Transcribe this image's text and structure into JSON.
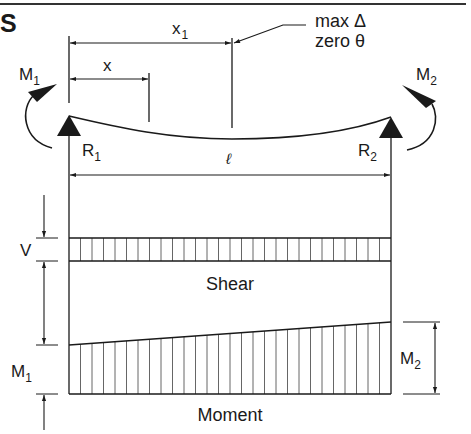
{
  "header": {
    "title_fragment": "S"
  },
  "beam": {
    "labels": {
      "x1": "x",
      "x1_sub": "1",
      "x": "x",
      "max_deflection": "max Δ",
      "zero_slope": "zero θ",
      "span": "ℓ",
      "left_moment": "M",
      "left_moment_sub": "1",
      "right_moment": "M",
      "right_moment_sub": "2",
      "left_reaction": "R",
      "left_reaction_sub": "1",
      "right_reaction": "R",
      "right_reaction_sub": "2"
    }
  },
  "shear_diagram": {
    "title": "Shear",
    "dimension_label": "V"
  },
  "moment_diagram": {
    "title": "Moment",
    "left_label": "M",
    "left_label_sub": "1",
    "right_label": "M",
    "right_label_sub": "2"
  },
  "colors": {
    "line": "#1a1a1a",
    "hatch": "#555555",
    "background": "#ffffff"
  }
}
